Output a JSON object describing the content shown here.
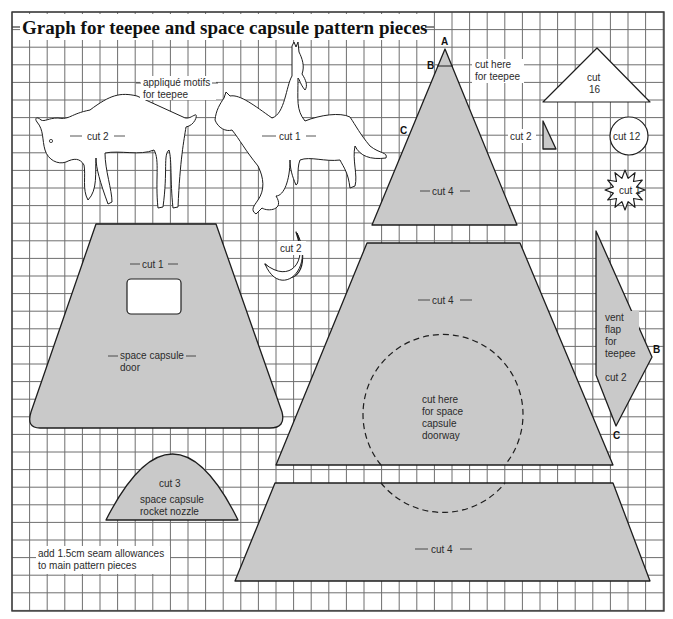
{
  "title": "Graph for teepee and space capsule pattern pieces",
  "colors": {
    "piece_fill": "#c9c9c9",
    "grid": "#6e6e6e",
    "outline": "#1e1e1e",
    "background": "#ffffff"
  },
  "grid": {
    "x0": 12,
    "y0": 12,
    "x1": 664,
    "y1": 611,
    "spacing": 17.6
  },
  "labels": {
    "applique": [
      "appliqué motifs",
      "for teepee"
    ],
    "buffalo_cut": "cut 2",
    "horse_cut": "cut 1",
    "teepee_cut": "cut 4",
    "teepee_cut_here": [
      "cut here",
      "for teepee"
    ],
    "teepee_points": {
      "a": "A",
      "b": "B",
      "c": "C"
    },
    "small_triangle_cut": "cut 2",
    "roof_triangle_cut": [
      "cut",
      "16"
    ],
    "circle_cut": "cut 12",
    "star_cut": "cut 1",
    "moon_cut": "cut 2",
    "door_cut": "cut 1",
    "door_name": [
      "space capsule",
      "door"
    ],
    "upper_trap_cut": "cut 4",
    "doorway": [
      "cut here",
      "for space",
      "capsule",
      "doorway"
    ],
    "vent_flap": [
      "vent",
      "flap",
      "for",
      "teepee"
    ],
    "vent_flap_cut": "cut 2",
    "vent_points": {
      "b": "B",
      "c": "C"
    },
    "nozzle_cut": "cut 3",
    "nozzle_name": [
      "space capsule",
      "rocket nozzle"
    ],
    "lower_trap_cut": "cut 4",
    "seam_note": [
      "add 1.5cm seam allowances",
      "to main pattern pieces"
    ]
  },
  "pieces": [
    {
      "id": "buffalo",
      "shape": "outline",
      "cut": 2,
      "name": "appliqué buffalo"
    },
    {
      "id": "horse-rider",
      "shape": "outline",
      "cut": 1,
      "name": "appliqué horse and rider"
    },
    {
      "id": "teepee-cone",
      "shape": "triangle",
      "cut": 4
    },
    {
      "id": "small-triangle",
      "shape": "triangle",
      "cut": 2
    },
    {
      "id": "roof-triangle",
      "shape": "triangle",
      "cut": 16
    },
    {
      "id": "circle",
      "shape": "circle",
      "cut": 12
    },
    {
      "id": "star",
      "shape": "star",
      "cut": 1
    },
    {
      "id": "moon",
      "shape": "crescent",
      "cut": 2
    },
    {
      "id": "capsule-door",
      "shape": "trapezoid",
      "cut": 1
    },
    {
      "id": "upper-trapezoid",
      "shape": "trapezoid",
      "cut": 4
    },
    {
      "id": "vent-flap",
      "shape": "quadrilateral",
      "cut": 2
    },
    {
      "id": "rocket-nozzle",
      "shape": "parabola",
      "cut": 3
    },
    {
      "id": "lower-trapezoid",
      "shape": "trapezoid",
      "cut": 4
    }
  ]
}
